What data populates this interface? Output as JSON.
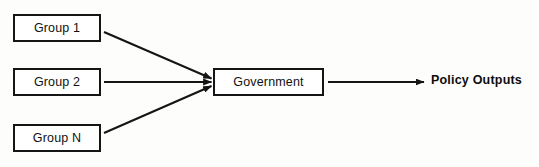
{
  "diagram": {
    "background_color": "#fdfdfc",
    "stroke_color": "#151515",
    "nodes": {
      "group_1": {
        "label": "Group 1",
        "shape": "rectangle"
      },
      "group_2": {
        "label": "Group 2",
        "shape": "rectangle"
      },
      "group_n": {
        "label": "Group N",
        "shape": "rectangle"
      },
      "government": {
        "label": "Government",
        "shape": "rectangle"
      },
      "policy_outputs": {
        "label": "Policy Outputs",
        "shape": "text"
      }
    },
    "edges": [
      {
        "name": "group-1-to-government",
        "from": "Group 1",
        "to": "Government",
        "style": "arrow",
        "direction": "diagonal-down-right"
      },
      {
        "name": "group-2-to-government",
        "from": "Group 2",
        "to": "Government",
        "style": "arrow",
        "direction": "horizontal-right"
      },
      {
        "name": "group-n-to-government",
        "from": "Group N",
        "to": "Government",
        "style": "arrow",
        "direction": "diagonal-up-right"
      },
      {
        "name": "government-to-policy-outputs",
        "from": "Government",
        "to": "Policy Outputs",
        "style": "arrow",
        "direction": "horizontal-right"
      }
    ]
  }
}
